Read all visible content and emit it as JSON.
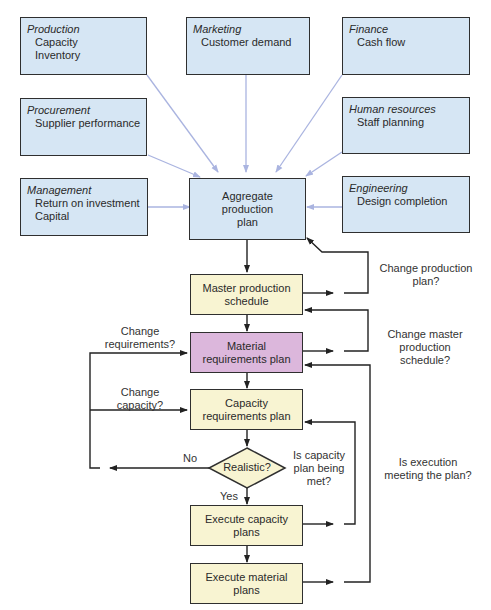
{
  "departments": [
    {
      "id": "production",
      "title": "Production",
      "items": [
        "Capacity",
        "Inventory"
      ]
    },
    {
      "id": "marketing",
      "title": "Marketing",
      "items": [
        "Customer demand"
      ]
    },
    {
      "id": "finance",
      "title": "Finance",
      "items": [
        "Cash flow"
      ]
    },
    {
      "id": "procurement",
      "title": "Procurement",
      "items": [
        "Supplier performance"
      ]
    },
    {
      "id": "human-resources",
      "title": "Human resources",
      "items": [
        "Staff planning"
      ]
    },
    {
      "id": "management",
      "title": "Management",
      "items": [
        "Return on investment",
        "Capital"
      ]
    },
    {
      "id": "engineering",
      "title": "Engineering",
      "items": [
        "Design completion"
      ]
    }
  ],
  "flow": {
    "aggregate": "Aggregate production plan",
    "mps": "Master production schedule",
    "mrp": "Material requirements plan",
    "crp": "Capacity requirements plan",
    "decision": "Realistic?",
    "exec_capacity": "Execute capacity plans",
    "exec_material": "Execute material plans"
  },
  "labels": {
    "change_production_plan": "Change production plan?",
    "change_mps": "Change master production schedule?",
    "change_requirements": "Change requirements?",
    "change_capacity": "Change capacity?",
    "no": "No",
    "yes": "Yes",
    "capacity_met": "Is capacity plan being met?",
    "execution_met": "Is execution meeting the plan?"
  },
  "colors": {
    "department_fill": "#d6e6f4",
    "process_fill": "#f8f4d2",
    "mrp_fill": "#dcb7dc",
    "input_arrow": "#aab4e0",
    "flow_arrow": "#2a2a2a"
  }
}
